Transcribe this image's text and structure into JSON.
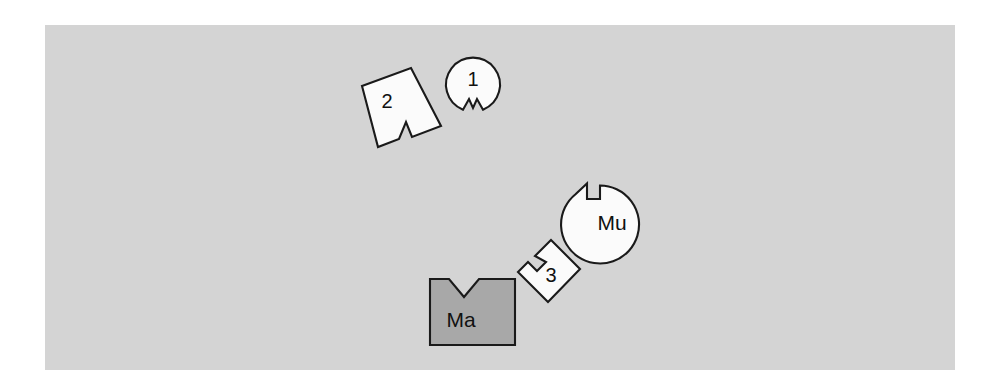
{
  "diagram": {
    "background_color": "#ffffff",
    "panel": {
      "name": "workspace-panel",
      "fill_color": "#d4d4d4",
      "x": 45,
      "y": 25,
      "width": 910,
      "height": 345
    },
    "outline_color": "#1a1a1a",
    "shape_light_fill": "#fbfbfb",
    "shape_dark_fill": "#a8a8a8",
    "shapes": [
      {
        "id": "shape-2",
        "label": "2",
        "form": "rotated-square",
        "notch": "v-notch-lower-right",
        "fill": "#fbfbfb",
        "label_x": 387,
        "label_y": 100,
        "rotation_deg": -22
      },
      {
        "id": "shape-1",
        "label": "1",
        "form": "circle",
        "notch": "v-notch-bottom",
        "fill": "#fbfbfb",
        "center_x": 473,
        "center_y": 84,
        "radius": 27,
        "label_x": 473,
        "label_y": 78
      },
      {
        "id": "shape-mu",
        "label": "Mu",
        "form": "circle",
        "notch": "rect-step-notch-upper-left",
        "fill": "#fbfbfb",
        "center_x": 609,
        "center_y": 221,
        "radius": 39,
        "label_x": 612,
        "label_y": 221
      },
      {
        "id": "shape-3",
        "label": "3",
        "form": "diamond",
        "notch": "rect-step-notch-upper-left",
        "fill": "#fbfbfb",
        "label_x": 551,
        "label_y": 273,
        "rotation_deg": 45
      },
      {
        "id": "shape-ma",
        "label": "Ma",
        "form": "square",
        "notch": "v-notch-top",
        "fill": "#a8a8a8",
        "x": 430,
        "y": 278,
        "width": 85,
        "height": 67,
        "label_x": 460,
        "label_y": 318
      }
    ]
  }
}
